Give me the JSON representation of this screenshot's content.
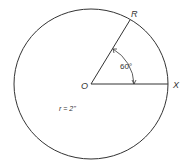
{
  "diagram": {
    "labels": {
      "center": "O",
      "point_r": "R",
      "point_x": "X",
      "angle": "60°",
      "radius": "r = 2''"
    },
    "colors": {
      "stroke": "#333333",
      "background": "#ffffff"
    }
  }
}
